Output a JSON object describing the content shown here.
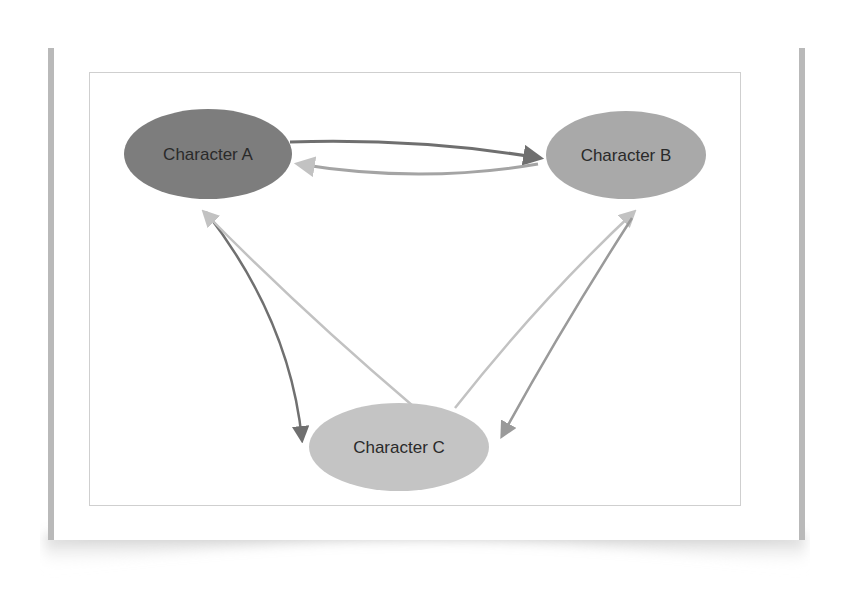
{
  "diagram": {
    "type": "relationship-graph",
    "colors": {
      "background": "#ffffff",
      "frame_border": "#cfcfcf",
      "paper_edge": "#b9b9b9",
      "node_a_fill": "#7d7d7d",
      "node_b_fill": "#a9a9a9",
      "node_c_fill": "#c4c4c4",
      "label_text": "#2a2a2a",
      "edge_dark": "#6f6f6f",
      "edge_medium": "#9a9a9a",
      "edge_light": "#c2c2c2"
    },
    "nodes": [
      {
        "id": "A",
        "label": "Character A"
      },
      {
        "id": "B",
        "label": "Character B"
      },
      {
        "id": "C",
        "label": "Character C"
      }
    ],
    "edges": [
      {
        "from": "A",
        "to": "B",
        "shade": "dark"
      },
      {
        "from": "B",
        "to": "A",
        "shade": "light"
      },
      {
        "from": "A",
        "to": "C",
        "shade": "dark"
      },
      {
        "from": "C",
        "to": "A",
        "shade": "light"
      },
      {
        "from": "C",
        "to": "B",
        "shade": "light"
      },
      {
        "from": "B",
        "to": "C",
        "shade": "medium"
      }
    ]
  }
}
